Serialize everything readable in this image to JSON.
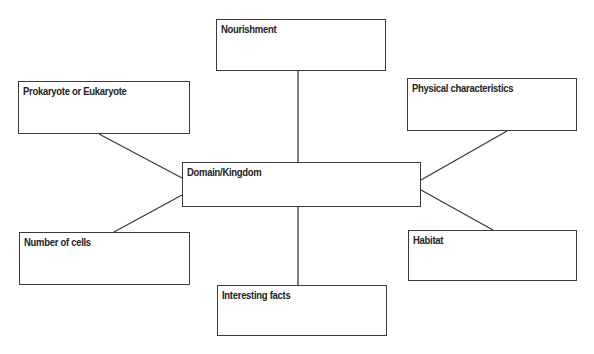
{
  "diagram": {
    "type": "concept-map",
    "center": {
      "label": "Domain/Kingdom"
    },
    "nodes": [
      {
        "id": "nourishment",
        "label": "Nourishment"
      },
      {
        "id": "prokaryote",
        "label": "Prokaryote or Eukaryote"
      },
      {
        "id": "physical",
        "label": "Physical characteristics"
      },
      {
        "id": "cells",
        "label": "Number of cells"
      },
      {
        "id": "habitat",
        "label": "Habitat"
      },
      {
        "id": "facts",
        "label": "Interesting facts"
      }
    ],
    "edges": [
      [
        "Domain/Kingdom",
        "Nourishment"
      ],
      [
        "Domain/Kingdom",
        "Prokaryote or Eukaryote"
      ],
      [
        "Domain/Kingdom",
        "Physical characteristics"
      ],
      [
        "Domain/Kingdom",
        "Number of cells"
      ],
      [
        "Domain/Kingdom",
        "Habitat"
      ],
      [
        "Domain/Kingdom",
        "Interesting facts"
      ]
    ],
    "colors": {
      "line": "#3a3a3a",
      "text": "#222222",
      "background": "#ffffff"
    }
  }
}
